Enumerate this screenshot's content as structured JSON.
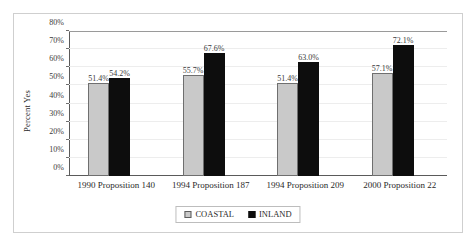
{
  "chart_data": {
    "type": "bar",
    "title": "",
    "xlabel": "",
    "ylabel": "Percent Yes",
    "ylim": [
      0,
      80
    ],
    "ytick_step": 10,
    "grid": true,
    "legend_position": "bottom",
    "categories": [
      "1990 Proposition 140",
      "1994 Proposition 187",
      "1994 Proposition 209",
      "2000 Proposition 22"
    ],
    "ytick_labels": [
      "0%",
      "10%",
      "20%",
      "30%",
      "40%",
      "50%",
      "60%",
      "70%",
      "80%"
    ],
    "series": [
      {
        "name": "COASTAL",
        "color": "#c9c9c9",
        "values": [
          51.4,
          55.7,
          51.4,
          57.1
        ],
        "labels": [
          "51.4%",
          "55.7%",
          "51.4%",
          "57.1%"
        ]
      },
      {
        "name": "INLAND",
        "color": "#0d0d0d",
        "values": [
          54.2,
          67.6,
          63.0,
          72.1
        ],
        "labels": [
          "54.2%",
          "67.6%",
          "63.0%",
          "72.1%"
        ]
      }
    ]
  }
}
